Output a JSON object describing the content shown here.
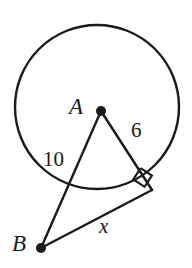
{
  "figure": {
    "kind": "circle-tangent-geometry-diagram",
    "background_color": "#ffffff",
    "stroke_color": "#1a1a1a",
    "circle": {
      "name": "circle-A",
      "center_x": 97,
      "center_y": 107,
      "radius": 82,
      "stroke_width": 2.4
    },
    "points": [
      {
        "id": "A",
        "label": "A",
        "x": 101,
        "y": 111,
        "dot_radius": 5,
        "role": "circle-center"
      },
      {
        "id": "B",
        "label": "B",
        "x": 41,
        "y": 248,
        "dot_radius": 5,
        "role": "external-point"
      },
      {
        "id": "T",
        "label": "",
        "x": 152,
        "y": 190,
        "dot_radius": 0,
        "role": "tangent-point"
      }
    ],
    "segments": [
      {
        "id": "AT",
        "from": "A",
        "to": "T",
        "label": "6",
        "stroke_width": 2.4
      },
      {
        "id": "AB",
        "from": "A",
        "to": "B",
        "label": "10",
        "stroke_width": 2.4
      },
      {
        "id": "BT",
        "from": "B",
        "to": "T",
        "label": "x",
        "stroke_width": 2.4
      }
    ],
    "right_angle": {
      "name": "right-angle-marker",
      "at_point": "T",
      "size": 15,
      "stroke_width": 2.2
    },
    "labels": {
      "point_a": "A",
      "point_b": "B",
      "radius_value": "6",
      "hypotenuse_value": "10",
      "tangent_value": "x"
    }
  }
}
